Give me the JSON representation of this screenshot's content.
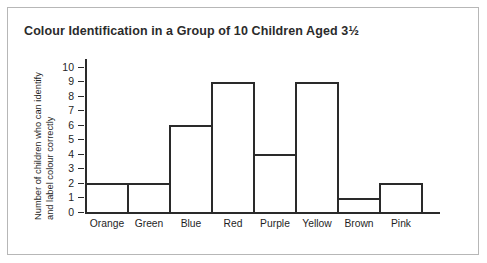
{
  "chart_data": {
    "type": "bar",
    "title": "Colour Identification in a Group of 10 Children Aged 3½",
    "xlabel": "",
    "ylabel": "Number of children who can identify and label colour correctly",
    "ylabel_line1": "Number of children who can identify",
    "ylabel_line2": "and label colour correctly",
    "categories": [
      "Orange",
      "Green",
      "Blue",
      "Red",
      "Purple",
      "Yellow",
      "Brown",
      "Pink"
    ],
    "values": [
      2,
      2,
      6,
      9,
      4,
      9,
      1,
      2
    ],
    "ylim": [
      0,
      10
    ],
    "yticks": [
      0,
      1,
      2,
      3,
      4,
      5,
      6,
      7,
      8,
      9,
      10
    ],
    "ytick_labels": [
      "0",
      "1",
      "2",
      "3",
      "4",
      "5",
      "6",
      "7",
      "8",
      "9",
      "10"
    ],
    "grid": false,
    "legend": false,
    "bar_style": "outline",
    "bar_fill": "#ffffff",
    "bar_edge_color": "#2a2a2a",
    "axis_color": "#2a2a2a",
    "background_color": "#ffffff",
    "border_color": "#b7b7b7",
    "text_color": "#1f1f1f"
  }
}
